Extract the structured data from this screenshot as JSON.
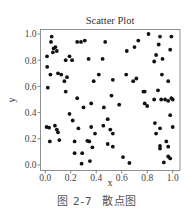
{
  "figure": {
    "caption_number": "图 2-7",
    "caption_text": "散点图"
  },
  "chart_data": {
    "type": "scatter",
    "title": "Scatter Plot",
    "xlabel": "x",
    "ylabel": "y",
    "xlim": [
      -0.04,
      1.03
    ],
    "ylim": [
      -0.03,
      1.04
    ],
    "xticks": [
      0.0,
      0.2,
      0.4,
      0.6,
      0.8,
      1.0
    ],
    "xtick_labels": [
      "0.0",
      "0.2",
      "0.4",
      "0.6",
      "0.8",
      "1.0"
    ],
    "yticks": [
      0.0,
      0.2,
      0.4,
      0.6,
      0.8,
      1.0
    ],
    "ytick_labels": [
      "0.0",
      "0.2",
      "0.4",
      "0.6",
      "0.8",
      "1.0"
    ],
    "grid": false,
    "legend": null,
    "marker_color": "#111111",
    "series": [
      {
        "name": "points",
        "points": [
          [
            0.05,
            0.98
          ],
          [
            0.045,
            0.94
          ],
          [
            0.08,
            0.9
          ],
          [
            0.065,
            0.89
          ],
          [
            0.06,
            0.86
          ],
          [
            0.09,
            0.87
          ],
          [
            0.013,
            0.83
          ],
          [
            0.25,
            0.94
          ],
          [
            0.28,
            0.94
          ],
          [
            0.31,
            0.95
          ],
          [
            0.47,
            0.94
          ],
          [
            0.16,
            0.8
          ],
          [
            0.19,
            0.83
          ],
          [
            0.21,
            0.8
          ],
          [
            0.34,
            0.81
          ],
          [
            0.45,
            0.81
          ],
          [
            0.015,
            0.75
          ],
          [
            0.1,
            0.7
          ],
          [
            0.125,
            0.69
          ],
          [
            0.04,
            0.69
          ],
          [
            0.15,
            0.64
          ],
          [
            0.17,
            0.67
          ],
          [
            0.42,
            0.69
          ],
          [
            0.38,
            0.64
          ],
          [
            0.02,
            0.59
          ],
          [
            0.16,
            0.56
          ],
          [
            0.25,
            0.51
          ],
          [
            0.3,
            0.44
          ],
          [
            0.36,
            0.47
          ],
          [
            0.46,
            0.44
          ],
          [
            0.49,
            0.35
          ],
          [
            0.19,
            0.39
          ],
          [
            0.215,
            0.34
          ],
          [
            0.26,
            0.28
          ],
          [
            0.36,
            0.29
          ],
          [
            0.455,
            0.3
          ],
          [
            0.39,
            0.24
          ],
          [
            0.01,
            0.29
          ],
          [
            0.03,
            0.285
          ],
          [
            0.075,
            0.3
          ],
          [
            0.09,
            0.27
          ],
          [
            0.1,
            0.25
          ],
          [
            0.035,
            0.18
          ],
          [
            0.11,
            0.19
          ],
          [
            0.23,
            0.18
          ],
          [
            0.33,
            0.185
          ],
          [
            0.345,
            0.18
          ],
          [
            0.37,
            0.135
          ],
          [
            0.49,
            0.16
          ],
          [
            0.23,
            0.09
          ],
          [
            0.29,
            0.09
          ],
          [
            0.285,
            0.01
          ],
          [
            0.35,
            0.03
          ],
          [
            0.81,
            1.0
          ],
          [
            0.9,
            0.98
          ],
          [
            0.99,
            0.98
          ],
          [
            0.73,
            0.95
          ],
          [
            0.7,
            0.9
          ],
          [
            0.64,
            0.87
          ],
          [
            0.89,
            0.92
          ],
          [
            0.98,
            0.88
          ],
          [
            0.87,
            0.84
          ],
          [
            0.92,
            0.81
          ],
          [
            0.855,
            0.79
          ],
          [
            0.635,
            0.69
          ],
          [
            0.915,
            0.69
          ],
          [
            0.53,
            0.65
          ],
          [
            0.715,
            0.66
          ],
          [
            0.69,
            0.64
          ],
          [
            0.965,
            0.64
          ],
          [
            0.77,
            0.56
          ],
          [
            0.78,
            0.56
          ],
          [
            0.885,
            0.57
          ],
          [
            0.52,
            0.53
          ],
          [
            0.58,
            0.46
          ],
          [
            0.51,
            0.27
          ],
          [
            0.53,
            0.24
          ],
          [
            0.53,
            0.14
          ],
          [
            0.61,
            0.06
          ],
          [
            0.66,
            0.015
          ],
          [
            0.78,
            0.47
          ],
          [
            0.8,
            0.45
          ],
          [
            0.855,
            0.5
          ],
          [
            0.91,
            0.5
          ],
          [
            0.94,
            0.5
          ],
          [
            0.965,
            0.49
          ],
          [
            0.99,
            0.51
          ],
          [
            1.0,
            0.5
          ],
          [
            0.98,
            0.38
          ],
          [
            0.86,
            0.32
          ],
          [
            0.9,
            0.28
          ],
          [
            1.0,
            0.29
          ],
          [
            0.87,
            0.24
          ],
          [
            0.95,
            0.18
          ],
          [
            0.9,
            0.145
          ],
          [
            0.9,
            0.125
          ],
          [
            0.965,
            0.14
          ],
          [
            0.965,
            0.065
          ],
          [
            0.98,
            0.05
          ],
          [
            0.93,
            0.02
          ]
        ]
      }
    ]
  }
}
